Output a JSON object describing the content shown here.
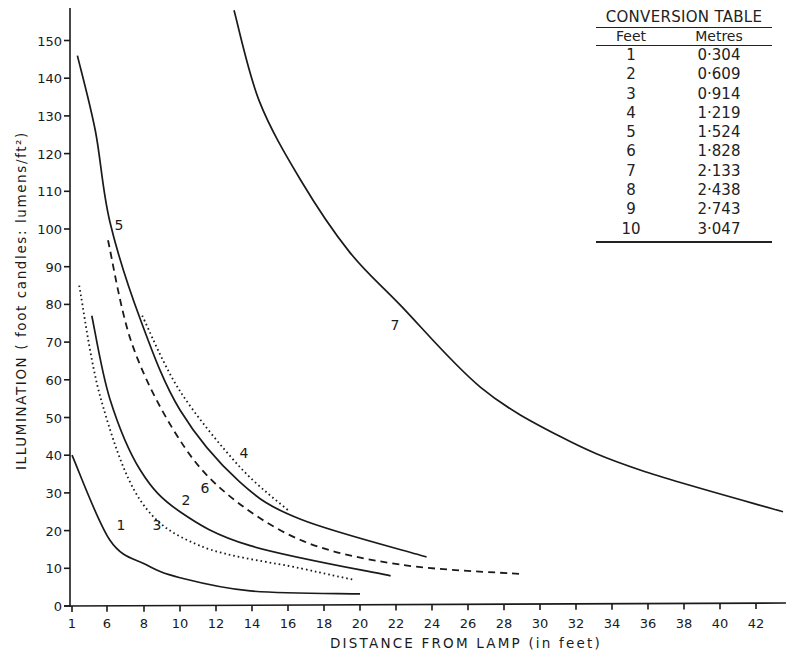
{
  "chart_data": {
    "type": "line",
    "title": "",
    "xlabel": "DISTANCE FROM LAMP (in feet)",
    "ylabel": "ILLUMINATION ( foot candles: lumens/ft²)",
    "x_ticks": [
      "1",
      "6",
      "8",
      "10",
      "12",
      "14",
      "16",
      "18",
      "20",
      "22",
      "24",
      "26",
      "28",
      "30",
      "32",
      "34",
      "36",
      "38",
      "40",
      "42"
    ],
    "y_ticks": [
      "0",
      "10",
      "20",
      "30",
      "40",
      "50",
      "60",
      "70",
      "80",
      "90",
      "100",
      "110",
      "120",
      "130",
      "140",
      "150"
    ],
    "ylim": [
      0,
      150
    ],
    "grid": false,
    "legend": "curves labelled inline 1-7",
    "series": [
      {
        "name": "1",
        "style": "solid",
        "x": [
          4,
          6.1,
          8.1,
          10,
          13.9,
          20
        ],
        "y": [
          40,
          17.5,
          11,
          7.5,
          4,
          3.2
        ],
        "label_pos": [
          121,
          530
        ]
      },
      {
        "name": "2",
        "style": "solid",
        "x": [
          5.1,
          6.1,
          7.8,
          10,
          13.9,
          21.7
        ],
        "y": [
          77,
          55,
          36,
          25,
          16,
          8
        ],
        "label_pos": [
          186,
          505
        ]
      },
      {
        "name": "3",
        "style": "dotted",
        "x": [
          4.4,
          5.6,
          7.8,
          11.1,
          16.7,
          19.6
        ],
        "y": [
          85,
          55,
          28,
          16,
          10,
          7
        ],
        "label_pos": [
          157,
          530
        ]
      },
      {
        "name": "4",
        "style": "dotted",
        "x": [
          7.9,
          10,
          13.3,
          16.1
        ],
        "y": [
          77,
          57,
          37,
          25
        ],
        "label_pos": [
          244,
          458
        ]
      },
      {
        "name": "5",
        "style": "solid",
        "x": [
          4.3,
          5.3,
          6.1,
          7.8,
          10,
          13.3,
          16.7,
          23.7
        ],
        "y": [
          146,
          126,
          102,
          76,
          52,
          33,
          23,
          13
        ],
        "label_pos": [
          119,
          230
        ]
      },
      {
        "name": "6",
        "style": "dashed",
        "x": [
          6,
          7.3,
          9.6,
          12.3,
          16.7,
          22.2,
          28.9
        ],
        "y": [
          97,
          70,
          47,
          31,
          17.5,
          11,
          8.5
        ],
        "label_pos": [
          205,
          493
        ]
      },
      {
        "name": "7",
        "style": "solid",
        "x": [
          13,
          14.4,
          16.7,
          19.4,
          22.2,
          26.7,
          31.1,
          35.6,
          43.5
        ],
        "y": [
          158,
          134,
          113,
          94,
          80,
          58,
          45,
          36,
          25
        ],
        "label_pos": [
          395,
          330
        ]
      }
    ],
    "colors": {
      "ink": "#1a1a1a",
      "background": "#ffffff"
    }
  },
  "conversion_table": {
    "title": "CONVERSION TABLE",
    "headers": [
      "Feet",
      "Metres"
    ],
    "rows": [
      [
        "1",
        "0·304"
      ],
      [
        "2",
        "0·609"
      ],
      [
        "3",
        "0·914"
      ],
      [
        "4",
        "1·219"
      ],
      [
        "5",
        "1·524"
      ],
      [
        "6",
        "1·828"
      ],
      [
        "7",
        "2·133"
      ],
      [
        "8",
        "2·438"
      ],
      [
        "9",
        "2·743"
      ],
      [
        "10",
        "3·047"
      ]
    ]
  }
}
